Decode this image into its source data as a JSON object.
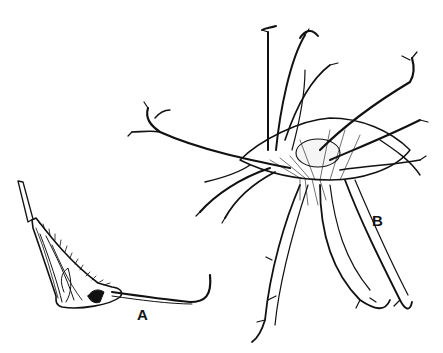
{
  "figure": {
    "panels": [
      {
        "id": "A",
        "label": "A",
        "subject": "single spiny fruit with long curved beak"
      },
      {
        "id": "B",
        "label": "B",
        "subject": "fruit with many branched, hooked spiny arms"
      }
    ]
  },
  "colors": {
    "ink": "#111111",
    "background": "#ffffff"
  }
}
